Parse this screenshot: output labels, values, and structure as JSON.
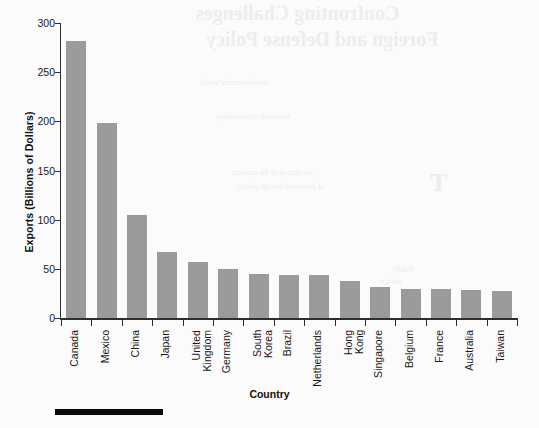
{
  "chart_data": {
    "type": "bar",
    "title": "",
    "xlabel": "Country",
    "ylabel": "Exports (Billions of Dollars)",
    "categories": [
      "Canada",
      "Mexico",
      "China",
      "Japan",
      "United Kingdom",
      "Germany",
      "South Korea",
      "Brazil",
      "Netherlands",
      "Hong Kong",
      "Singapore",
      "Belgium",
      "France",
      "Australia",
      "Taiwan"
    ],
    "values": [
      282,
      198,
      105,
      67,
      57,
      50,
      45,
      44,
      44,
      38,
      32,
      30,
      29,
      28,
      27
    ],
    "ylim": [
      0,
      300
    ],
    "yticks": [
      0,
      50,
      100,
      150,
      200,
      250,
      300
    ],
    "grid": false,
    "legend": null,
    "bar_color": "#9a9b9a",
    "axis_color": "#2e2e2e"
  },
  "bleed_text": {
    "line1": "Confronting Challenges",
    "line2": "Foreign and Defense Policy",
    "line3": "interdependent world",
    "line4": "economic relationships",
    "line5": "are central to the conduct",
    "line6": "of American foreign policy",
    "line7": "T",
    "line8": "trade",
    "line9": "policy"
  },
  "footer": {
    "rule_color": "#0a0a0a"
  }
}
